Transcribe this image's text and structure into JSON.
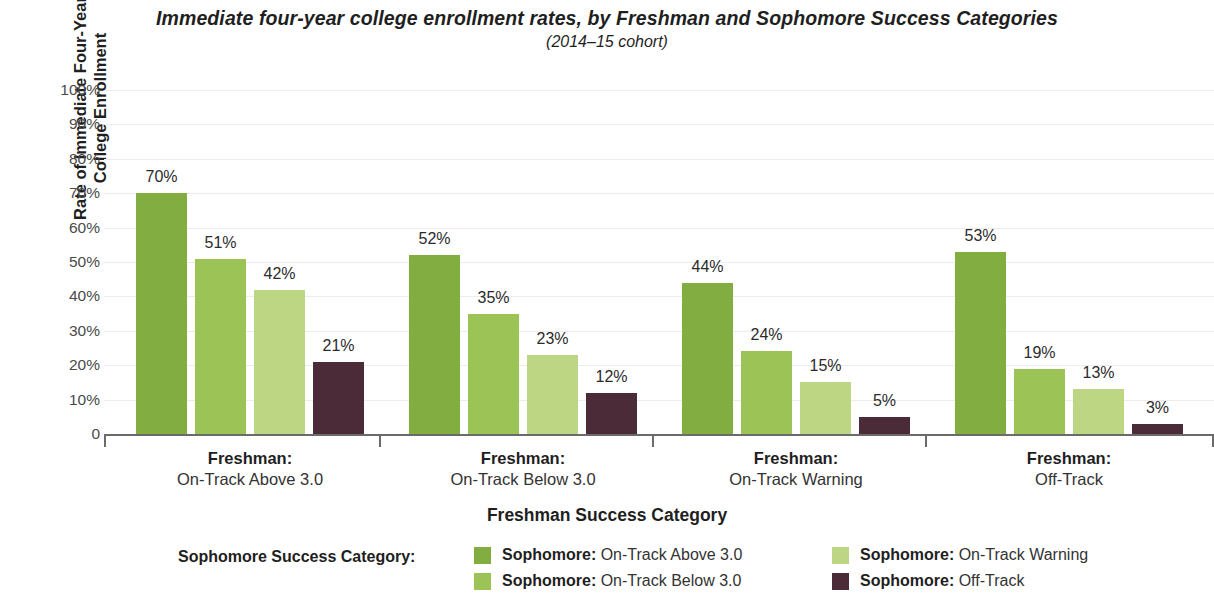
{
  "chart_data": {
    "type": "bar",
    "title": "Immediate four-year college enrollment rates, by Freshman and Sophomore Success Categories",
    "subtitle": "(2014–15 cohort)",
    "xlabel": "Freshman Success Category",
    "ylabel": "Rate of Immediate Four-Year\nCollege Enrollment",
    "ylim": [
      0,
      100
    ],
    "grid": true,
    "legend_position": "bottom",
    "legend_title": "Sophomore Success Category:",
    "ytick_labels": [
      "100%",
      "90%",
      "80%",
      "70%",
      "60%",
      "50%",
      "40%",
      "30%",
      "20%",
      "10%",
      "0"
    ],
    "ytick_values": [
      100,
      90,
      80,
      70,
      60,
      50,
      40,
      30,
      20,
      10,
      0
    ],
    "categories": [
      {
        "line1": "Freshman:",
        "line2": "On-Track Above 3.0"
      },
      {
        "line1": "Freshman:",
        "line2": "On-Track Below 3.0"
      },
      {
        "line1": "Freshman:",
        "line2": "On-Track Warning"
      },
      {
        "line1": "Freshman:",
        "line2": "Off-Track"
      }
    ],
    "series": [
      {
        "name": "Sophomore: On-Track Above 3.0",
        "name_bold": "Sophomore:",
        "name_rest": " On-Track Above 3.0",
        "color": "#82ad40",
        "values": [
          70,
          52,
          44,
          53
        ],
        "labels": [
          "70%",
          "52%",
          "44%",
          "53%"
        ]
      },
      {
        "name": "Sophomore: On-Track Below 3.0",
        "name_bold": "Sophomore:",
        "name_rest": " On-Track Below 3.0",
        "color": "#9cc355",
        "values": [
          51,
          35,
          24,
          19
        ],
        "labels": [
          "51%",
          "35%",
          "24%",
          "19%"
        ]
      },
      {
        "name": "Sophomore: On-Track Warning",
        "name_bold": "Sophomore:",
        "name_rest": " On-Track Warning",
        "color": "#bcd684",
        "values": [
          42,
          23,
          15,
          13
        ],
        "labels": [
          "42%",
          "23%",
          "15%",
          "13%"
        ]
      },
      {
        "name": "Sophomore: Off-Track",
        "name_bold": "Sophomore:",
        "name_rest": " Off-Track",
        "color": "#4c2b39",
        "values": [
          21,
          12,
          5,
          3
        ],
        "labels": [
          "21%",
          "12%",
          "5%",
          "3%"
        ]
      }
    ]
  }
}
